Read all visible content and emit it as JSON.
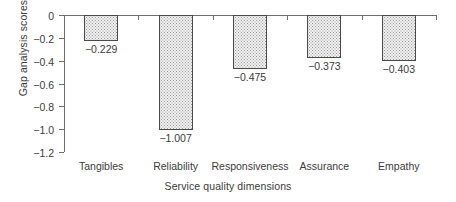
{
  "chart_data": {
    "type": "bar",
    "title": "",
    "xlabel": "Service quality dimensions",
    "ylabel": "Gap analysis scores",
    "categories": [
      "Tangibles",
      "Reliability",
      "Responsiveness",
      "Assurance",
      "Empathy"
    ],
    "values": [
      -0.229,
      -1.007,
      -0.475,
      -0.373,
      -0.403
    ],
    "value_labels": [
      "−0.229",
      "−1.007",
      "−0.475",
      "−0.373",
      "−0.403"
    ],
    "ylim": [
      -1.2,
      0
    ],
    "yticks": [
      0,
      -0.2,
      -0.4,
      -0.6,
      -0.8,
      -1.0,
      -1.2
    ],
    "ytick_labels": [
      "0",
      "−0.2",
      "−0.4",
      "−0.6",
      "−0.8",
      "−1.0",
      "−1.2"
    ],
    "grid": false,
    "legend": null,
    "bar_fill": "#f0f0f0",
    "bar_edge": "#4a4a4a",
    "axis_color": "#6d6d6d",
    "text_color": "#3b3b3b"
  }
}
